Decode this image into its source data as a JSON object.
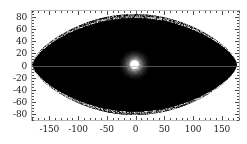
{
  "figure": {
    "width": 247,
    "height": 144,
    "background": "#ffffff"
  },
  "plot": {
    "frame_color": "#b9b9b9",
    "left": 31,
    "top": 10,
    "width": 209,
    "height": 111,
    "field_color": "#000000",
    "hotspot_color": "#ffffff"
  },
  "chart_data": {
    "type": "heatmap",
    "title": "",
    "subtitle": "",
    "xlabel": "",
    "ylabel": "",
    "projection": "aitoff-lens",
    "grid": false,
    "legend": null,
    "xlim": [
      -180,
      180
    ],
    "ylim": [
      -90,
      90
    ],
    "xticks": [
      -150,
      -100,
      -50,
      0,
      50,
      100,
      150
    ],
    "xtick_labels": [
      "-150",
      "-100",
      "-50",
      "0",
      "50",
      "100",
      "150"
    ],
    "xtick_minor_step": 10,
    "yticks": [
      -80,
      -60,
      -40,
      -20,
      0,
      20,
      40,
      60,
      80
    ],
    "ytick_labels": [
      "-80",
      "-60",
      "-40",
      "-20",
      "0",
      "20",
      "40",
      "60",
      "80"
    ],
    "ytick_minor_step": 5,
    "colormap": "grayscale-black-to-white",
    "footprint": {
      "shape": "lens",
      "top_vertex": [
        0,
        85
      ],
      "bottom_vertex": [
        0,
        -85
      ],
      "left_vertex": [
        -180,
        0
      ],
      "right_vertex": [
        180,
        0
      ]
    },
    "hotspot": {
      "center_x": 0,
      "center_y": 0,
      "core_radius_deg": 9,
      "halo_radius_deg": 32,
      "peak_value": 1.0
    }
  }
}
